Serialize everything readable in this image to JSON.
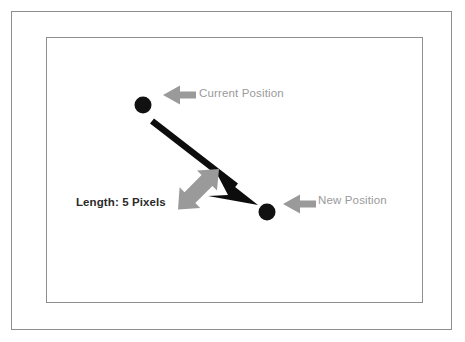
{
  "figure": {
    "title_visible": false,
    "background_color": "#ffffff",
    "frames": [
      {
        "name": "outer-frame",
        "stroke": "#8e8e8e"
      },
      {
        "name": "inner-frame",
        "stroke": "#8e8e8e"
      }
    ]
  },
  "labels": {
    "current_position": "Current Position",
    "new_position": "New Position",
    "length": "Length: 5 Pixels"
  },
  "colors": {
    "vector_arrow": "#0d0d0d",
    "point_marker": "#111111",
    "callout_arrow": "#9a9a9a",
    "label_gray": "#9a9a9a",
    "label_dark": "#2a2a2a",
    "frame_stroke": "#8e8e8e"
  },
  "points": [
    {
      "name": "current-position-point",
      "cx": 143,
      "cy": 105,
      "r": 8.5
    },
    {
      "name": "new-position-point",
      "cx": 267,
      "cy": 212,
      "r": 8.5
    }
  ],
  "vector": {
    "name": "movement-vector-arrow",
    "from_x": 152,
    "from_y": 121,
    "to_x": 258,
    "to_y": 203,
    "length_label": "Length: 5 Pixels"
  },
  "callouts": [
    {
      "name": "current-position-callout-arrow",
      "direction": "left",
      "tip_x": 163,
      "tip_y": 95
    },
    {
      "name": "new-position-callout-arrow",
      "direction": "left",
      "tip_x": 283,
      "tip_y": 204
    },
    {
      "name": "length-callout-arrow",
      "direction": "up-right",
      "tip_x": 218,
      "tip_y": 170
    }
  ]
}
